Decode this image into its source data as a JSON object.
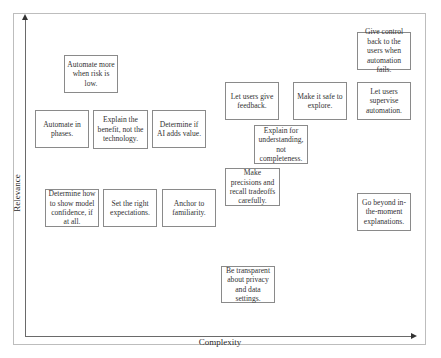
{
  "diagram": {
    "type": "2x2-style scatter of guideline cards",
    "axes": {
      "x_label": "Complexity",
      "y_label": "Relevance"
    },
    "cards": [
      {
        "id": "automate-more-low-risk",
        "text": "Automate more when risk is low.",
        "x": 64,
        "y": 55,
        "w": 54,
        "h": 38
      },
      {
        "id": "automate-in-phases",
        "text": "Automate in phases.",
        "x": 35,
        "y": 110,
        "w": 54,
        "h": 38
      },
      {
        "id": "explain-benefit",
        "text": "Explain the benefit, not the technology.",
        "x": 93,
        "y": 110,
        "w": 55,
        "h": 39
      },
      {
        "id": "determine-if-ai-adds-value",
        "text": "Determine if AI adds value.",
        "x": 152,
        "y": 110,
        "w": 54,
        "h": 38
      },
      {
        "id": "let-users-give-feedback",
        "text": "Let users give feedback.",
        "x": 225,
        "y": 82,
        "w": 54,
        "h": 38
      },
      {
        "id": "make-it-safe-to-explore",
        "text": "Make it safe to explore.",
        "x": 293,
        "y": 82,
        "w": 54,
        "h": 38
      },
      {
        "id": "let-users-supervise",
        "text": "Let users supervise automation.",
        "x": 357,
        "y": 82,
        "w": 54,
        "h": 38
      },
      {
        "id": "give-control-back",
        "text": "Give control back to the users when automation fails.",
        "x": 357,
        "y": 32,
        "w": 54,
        "h": 38
      },
      {
        "id": "explain-for-understanding",
        "text": "Explain for understanding, not completeness.",
        "x": 254,
        "y": 125,
        "w": 54,
        "h": 39
      },
      {
        "id": "precision-recall-tradeoffs",
        "text": "Make precisions and recall tradeoffs carefully.",
        "x": 225,
        "y": 168,
        "w": 55,
        "h": 38
      },
      {
        "id": "show-model-confidence",
        "text": "Determine how to show model confidence, if at all.",
        "x": 45,
        "y": 189,
        "w": 54,
        "h": 38
      },
      {
        "id": "set-right-expectations",
        "text": "Set the right expectations.",
        "x": 103,
        "y": 189,
        "w": 54,
        "h": 38
      },
      {
        "id": "anchor-to-familiarity",
        "text": "Anchor to familiarity.",
        "x": 162,
        "y": 189,
        "w": 54,
        "h": 38
      },
      {
        "id": "go-beyond-explanations",
        "text": "Go beyond in-the-moment explanations.",
        "x": 357,
        "y": 193,
        "w": 54,
        "h": 38
      },
      {
        "id": "transparent-privacy",
        "text": "Be transparent about privacy and data settings.",
        "x": 221,
        "y": 266,
        "w": 54,
        "h": 37
      }
    ]
  }
}
